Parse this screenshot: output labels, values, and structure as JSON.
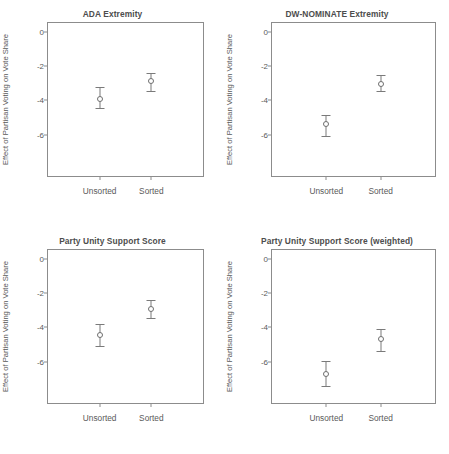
{
  "figure": {
    "layout": "2x2 panel grid",
    "background_color": "#ffffff",
    "frame_color": "#8c8c8c",
    "text_color": "#595959",
    "marker_color": "#6e6e6e"
  },
  "axis": {
    "ylabel": "Effect of Partisan Voting on Vote Share",
    "yticks": [
      "0",
      "-2",
      "-4",
      "-6"
    ],
    "ytick_values": [
      0,
      -2,
      -4,
      -6
    ],
    "ylim": [
      -8.4,
      0.5
    ],
    "xcategories": [
      "Unsorted",
      "Sorted"
    ]
  },
  "panels": [
    {
      "id": "ada-extremity",
      "title": "ADA Extremity",
      "points": [
        {
          "label": "Unsorted",
          "value": -3.9,
          "low": -4.45,
          "high": -3.25
        },
        {
          "label": "Sorted",
          "value": -2.9,
          "low": -3.45,
          "high": -2.4
        }
      ]
    },
    {
      "id": "dw-nominate-extremity",
      "title": "DW-NOMINATE Extremity",
      "points": [
        {
          "label": "Unsorted",
          "value": -5.4,
          "low": -6.05,
          "high": -4.85
        },
        {
          "label": "Sorted",
          "value": -3.05,
          "low": -3.45,
          "high": -2.55
        }
      ]
    },
    {
      "id": "party-unity-support-score",
      "title": "Party Unity Support Score",
      "points": [
        {
          "label": "Unsorted",
          "value": -4.45,
          "low": -5.1,
          "high": -3.8
        },
        {
          "label": "Sorted",
          "value": -2.95,
          "low": -3.45,
          "high": -2.4
        }
      ]
    },
    {
      "id": "party-unity-support-score-weighted",
      "title": "Party Unity Support Score (weighted)",
      "points": [
        {
          "label": "Unsorted",
          "value": -6.7,
          "low": -7.4,
          "high": -5.95
        },
        {
          "label": "Sorted",
          "value": -4.7,
          "low": -5.35,
          "high": -4.1
        }
      ]
    }
  ],
  "chart_data": {
    "type": "scatter",
    "title": "",
    "subplots": [
      {
        "title": "ADA Extremity",
        "categories": [
          "Unsorted",
          "Sorted"
        ],
        "values": [
          -3.9,
          -2.9
        ],
        "error_low": [
          -4.45,
          -3.45
        ],
        "error_high": [
          -3.25,
          -2.4
        ],
        "xlabel": "",
        "ylabel": "Effect of Partisan Voting on Vote Share",
        "ylim": [
          -8.4,
          0.5
        ],
        "yticks": [
          0,
          -2,
          -4,
          -6
        ],
        "grid": false,
        "legend": "none"
      },
      {
        "title": "DW-NOMINATE Extremity",
        "categories": [
          "Unsorted",
          "Sorted"
        ],
        "values": [
          -5.4,
          -3.05
        ],
        "error_low": [
          -6.05,
          -3.45
        ],
        "error_high": [
          -4.85,
          -2.55
        ],
        "xlabel": "",
        "ylabel": "Effect of Partisan Voting on Vote Share",
        "ylim": [
          -8.4,
          0.5
        ],
        "yticks": [
          0,
          -2,
          -4,
          -6
        ],
        "grid": false,
        "legend": "none"
      },
      {
        "title": "Party Unity Support Score",
        "categories": [
          "Unsorted",
          "Sorted"
        ],
        "values": [
          -4.45,
          -2.95
        ],
        "error_low": [
          -5.1,
          -3.45
        ],
        "error_high": [
          -3.8,
          -2.4
        ],
        "xlabel": "",
        "ylabel": "Effect of Partisan Voting on Vote Share",
        "ylim": [
          -8.4,
          0.5
        ],
        "yticks": [
          0,
          -2,
          -4,
          -6
        ],
        "grid": false,
        "legend": "none"
      },
      {
        "title": "Party Unity Support Score (weighted)",
        "categories": [
          "Unsorted",
          "Sorted"
        ],
        "values": [
          -6.7,
          -4.7
        ],
        "error_low": [
          -7.4,
          -5.35
        ],
        "error_high": [
          -5.95,
          -4.1
        ],
        "xlabel": "",
        "ylabel": "Effect of Partisan Voting on Vote Share",
        "ylim": [
          -8.4,
          0.5
        ],
        "yticks": [
          0,
          -2,
          -4,
          -6
        ],
        "grid": false,
        "legend": "none"
      }
    ]
  }
}
